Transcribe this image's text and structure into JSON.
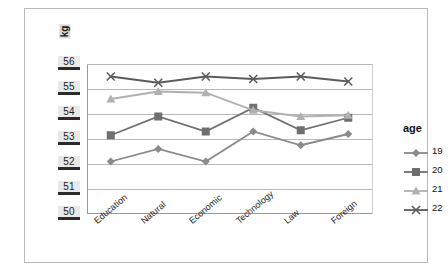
{
  "axis": {
    "unit_label": "kg",
    "y_ticks": [
      "56",
      "55",
      "54",
      "53",
      "52",
      "51",
      "50"
    ],
    "x_ticks": [
      "Education",
      "Natural",
      "Economic",
      "Technology",
      "Law",
      "Foreign"
    ]
  },
  "legend": {
    "title": "age",
    "entries": [
      {
        "label": "19",
        "marker": "diamond-marker",
        "color": "#8a8a8a"
      },
      {
        "label": "20",
        "marker": "square-marker",
        "color": "#6f6f6f"
      },
      {
        "label": "21",
        "marker": "triangle-marker",
        "color": "#b0b0b0"
      },
      {
        "label": "22",
        "marker": "x-marker",
        "color": "#5c5c5c"
      }
    ]
  },
  "chart_data": {
    "type": "line",
    "title": "",
    "xlabel": "",
    "ylabel": "kg",
    "ylim": [
      50,
      56
    ],
    "grid": true,
    "legend_position": "right",
    "legend_title": "age",
    "categories": [
      "Education",
      "Natural",
      "Economic",
      "Technology",
      "Law",
      "Foreign"
    ],
    "series": [
      {
        "name": "19",
        "values": [
          52.1,
          52.6,
          52.1,
          53.3,
          52.75,
          53.2
        ],
        "color": "#8a8a8a",
        "marker": "diamond"
      },
      {
        "name": "20",
        "values": [
          53.15,
          53.9,
          53.3,
          54.25,
          53.35,
          53.85
        ],
        "color": "#6f6f6f",
        "marker": "square"
      },
      {
        "name": "21",
        "values": [
          54.6,
          54.9,
          54.85,
          54.15,
          53.9,
          53.95
        ],
        "color": "#b0b0b0",
        "marker": "triangle"
      },
      {
        "name": "22",
        "values": [
          55.5,
          55.25,
          55.5,
          55.4,
          55.5,
          55.3
        ],
        "color": "#5c5c5c",
        "marker": "x"
      }
    ]
  }
}
